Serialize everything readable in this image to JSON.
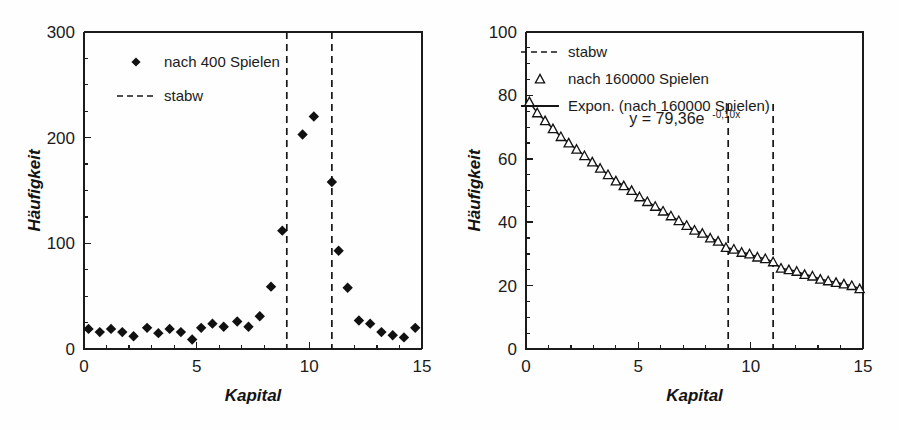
{
  "figure": {
    "background": "#fefefe",
    "ink": "#161616"
  },
  "chart_data": [
    {
      "id": "left",
      "type": "scatter",
      "title": "",
      "xlabel": "Kapital",
      "ylabel": "Häufigkeit",
      "xlim": [
        0,
        15
      ],
      "ylim": [
        0,
        300
      ],
      "xticks": [
        0,
        5,
        10,
        15
      ],
      "xticklabels": [
        "0",
        "5",
        "10",
        "15"
      ],
      "xminor_step": 1,
      "yticks": [
        0,
        100,
        200,
        300
      ],
      "yticklabels": [
        "0",
        "100",
        "200",
        "300"
      ],
      "yminor_step": 25,
      "grid": false,
      "legend_position": "top-left",
      "legend": [
        {
          "label": "nach 400 Spielen",
          "marker": "diamond"
        },
        {
          "label": "stabw",
          "marker": "dashed-line"
        }
      ],
      "vlines": [
        {
          "x": 9,
          "label": "stabw"
        },
        {
          "x": 11,
          "label": "stabw"
        }
      ],
      "series": [
        {
          "name": "nach 400 Spielen",
          "marker": "diamond",
          "x": [
            0.2,
            0.7,
            1.2,
            1.7,
            2.2,
            2.8,
            3.3,
            3.8,
            4.3,
            4.8,
            5.2,
            5.7,
            6.2,
            6.8,
            7.3,
            7.8,
            8.3,
            8.8,
            9.7,
            10.2,
            11.0,
            11.3,
            11.7,
            12.2,
            12.7,
            13.2,
            13.7,
            14.2,
            14.7
          ],
          "y": [
            19,
            16,
            19,
            16,
            12,
            20,
            15,
            19,
            16,
            9,
            20,
            24,
            21,
            26,
            21,
            31,
            59,
            112,
            203,
            220,
            158,
            93,
            58,
            27,
            24,
            16,
            13,
            11,
            20
          ]
        }
      ]
    },
    {
      "id": "right",
      "type": "line",
      "title": "",
      "xlabel": "Kapital",
      "ylabel": "Häufigkeit",
      "xlim": [
        0,
        15
      ],
      "ylim": [
        0,
        100
      ],
      "xticks": [
        0,
        5,
        10,
        15
      ],
      "xticklabels": [
        "0",
        "5",
        "10",
        "15"
      ],
      "xminor_step": 1,
      "yticks": [
        0,
        20,
        40,
        60,
        80,
        100
      ],
      "yticklabels": [
        "0",
        "20",
        "40",
        "60",
        "80",
        "100"
      ],
      "yminor_step": 5,
      "grid": false,
      "legend_position": "top-left",
      "legend": [
        {
          "label": "stabw",
          "marker": "dashed-line"
        },
        {
          "label": "nach 160000 Spielen",
          "marker": "triangle"
        },
        {
          "label": "Expon. (nach 160000 Spielen)",
          "marker": "solid-line"
        }
      ],
      "annotation": {
        "text_main": "y = 79,36e",
        "text_sup": "-0,10x",
        "x": 4.6,
        "y": 71
      },
      "fit": {
        "expression": "y = 79,36e^(-0,10x)",
        "a": 79.36,
        "b": -0.1
      },
      "vlines": [
        {
          "x": 9,
          "label": "stabw"
        },
        {
          "x": 11,
          "label": "stabw"
        }
      ],
      "series": [
        {
          "name": "nach 160000 Spielen",
          "marker": "triangle",
          "x": [
            0.15,
            0.5,
            0.85,
            1.2,
            1.55,
            1.9,
            2.25,
            2.6,
            2.95,
            3.3,
            3.65,
            4.0,
            4.35,
            4.7,
            5.05,
            5.4,
            5.75,
            6.1,
            6.45,
            6.8,
            7.15,
            7.5,
            7.85,
            8.2,
            8.55,
            8.9,
            9.25,
            9.6,
            9.95,
            10.3,
            10.65,
            11.0,
            11.35,
            11.7,
            12.05,
            12.4,
            12.75,
            13.1,
            13.45,
            13.8,
            14.15,
            14.5,
            14.85
          ],
          "y": [
            78.0,
            74.5,
            72.0,
            69.5,
            67.0,
            65.0,
            63.0,
            61.0,
            59.0,
            57.0,
            55.0,
            53.0,
            51.5,
            50.0,
            48.0,
            46.5,
            45.0,
            43.5,
            42.0,
            40.5,
            39.0,
            37.5,
            36.5,
            35.0,
            34.0,
            32.0,
            31.5,
            30.5,
            30.0,
            29.0,
            28.5,
            27.5,
            25.5,
            25.0,
            24.5,
            23.5,
            23.0,
            22.0,
            21.5,
            21.0,
            20.5,
            20.0,
            19.0
          ]
        }
      ]
    }
  ]
}
